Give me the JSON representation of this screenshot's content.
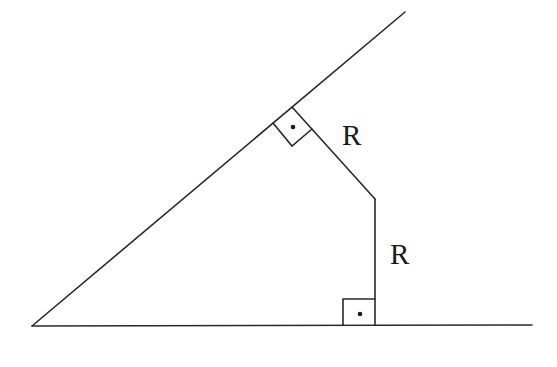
{
  "diagram": {
    "type": "geometry",
    "labels": {
      "upper_distance": "R",
      "lower_distance": "R"
    },
    "colors": {
      "line": "#2a2a2a",
      "background": "#ffffff"
    }
  }
}
